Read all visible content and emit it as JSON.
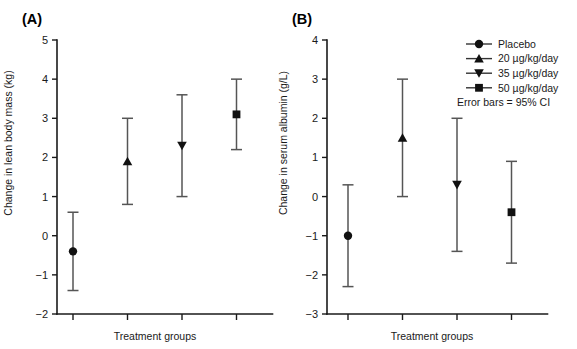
{
  "figure": {
    "background_color": "#ffffff",
    "marker_color": "#111111",
    "errorbar_color": "#555555",
    "axis_color": "#1a1a1a"
  },
  "legend": {
    "position": "top-right",
    "entries": [
      {
        "label": "Placebo",
        "marker": "circle-icon"
      },
      {
        "label": "20 µg/kg/day",
        "marker": "triangle-up-icon"
      },
      {
        "label": "35 µg/kg/day",
        "marker": "triangle-down-icon"
      },
      {
        "label": "50 µg/kg/day",
        "marker": "square-icon"
      }
    ],
    "note": "Error bars = 95% CI"
  },
  "chart_data": [
    {
      "panel": "(A)",
      "type": "scatter",
      "title": "",
      "xlabel": "Treatment groups",
      "ylabel": "Change in lean body mass (kg)",
      "categories": [
        "Placebo",
        "20 µg/kg/day",
        "35 µg/kg/day",
        "50 µg/kg/day"
      ],
      "markers": [
        "circle",
        "triangle-up",
        "triangle-down",
        "square"
      ],
      "values": [
        -0.4,
        1.9,
        2.3,
        3.1
      ],
      "err_low": [
        -1.4,
        0.8,
        1.0,
        2.2
      ],
      "err_high": [
        0.6,
        3.0,
        3.6,
        4.0
      ],
      "ylim": [
        -2,
        5
      ],
      "yticks": [
        -2,
        -1,
        0,
        1,
        2,
        3,
        4,
        5
      ],
      "ytick_labels": [
        "−2",
        "−1",
        "0",
        "1",
        "2",
        "3",
        "4",
        "5"
      ],
      "xtick_labels": [
        "",
        "",
        "",
        ""
      ],
      "grid": false,
      "errorbar_type": "95% CI"
    },
    {
      "panel": "(B)",
      "type": "scatter",
      "title": "",
      "xlabel": "Treatment groups",
      "ylabel": "Change in serum albumin (g/L)",
      "categories": [
        "Placebo",
        "20 µg/kg/day",
        "35 µg/kg/day",
        "50 µg/kg/day"
      ],
      "markers": [
        "circle",
        "triangle-up",
        "triangle-down",
        "square"
      ],
      "values": [
        -1.0,
        1.5,
        0.3,
        -0.4
      ],
      "err_low": [
        -2.3,
        0.0,
        -1.4,
        -1.7
      ],
      "err_high": [
        0.3,
        3.0,
        2.0,
        0.9
      ],
      "ylim": [
        -3,
        4
      ],
      "yticks": [
        -3,
        -2,
        -1,
        0,
        1,
        2,
        3,
        4
      ],
      "ytick_labels": [
        "−3",
        "−2",
        "−1",
        "0",
        "1",
        "2",
        "3",
        "4"
      ],
      "xtick_labels": [
        "",
        "",
        "",
        ""
      ],
      "grid": false,
      "errorbar_type": "95% CI"
    }
  ]
}
